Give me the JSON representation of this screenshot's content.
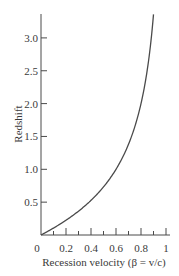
{
  "chart_data": {
    "type": "line",
    "title": "",
    "xlabel": "Recession velocity (β = v/c)",
    "ylabel": "Redshift",
    "xlim": [
      0,
      1
    ],
    "ylim": [
      0,
      3.4
    ],
    "grid": false,
    "legend": null,
    "x_ticks": [
      "0",
      "0.2",
      "0.4",
      "0.6",
      "0.8",
      "1"
    ],
    "x_minor_ticks": [
      0.1,
      0.3,
      0.5,
      0.7,
      0.9
    ],
    "y_ticks": [
      "0.5",
      "1.0",
      "1.5",
      "2.0",
      "2.5",
      "3.0"
    ],
    "series": [
      {
        "name": "Relativistic redshift z = sqrt((1+β)/(1−β)) − 1",
        "x": [
          0,
          0.1,
          0.2,
          0.3,
          0.4,
          0.5,
          0.6,
          0.7,
          0.8,
          0.85,
          0.9,
          0.92
        ],
        "values": [
          0,
          0.11,
          0.22,
          0.36,
          0.53,
          0.73,
          1.0,
          1.38,
          2.0,
          2.51,
          3.36,
          3.9
        ]
      }
    ]
  }
}
